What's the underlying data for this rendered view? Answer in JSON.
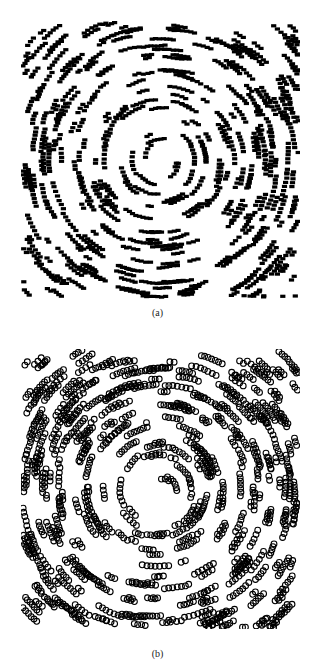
{
  "figure": {
    "panels": [
      {
        "id": "a",
        "caption": "(a)",
        "marker": "filled-rect"
      },
      {
        "id": "b",
        "caption": "(b)",
        "marker": "open-circle"
      }
    ]
  },
  "chart_data": [
    {
      "type": "scatter",
      "title": "",
      "caption": "(a)",
      "xlabel": "",
      "ylabel": "",
      "axes_visible": false,
      "grid": false,
      "legend": null,
      "marker": "small filled black rectangles",
      "pattern": "particles arranged along concentric circular swirl (vortex) around center; denser at corners, sparser near center",
      "approx_point_count": 1600,
      "xlim": [
        0,
        1
      ],
      "ylim": [
        0,
        1
      ],
      "generator": {
        "seed": 7,
        "count": 1600,
        "center": [
          0.5,
          0.5
        ]
      },
      "color": "#000000"
    },
    {
      "type": "scatter",
      "title": "",
      "caption": "(b)",
      "xlabel": "",
      "ylabel": "",
      "axes_visible": false,
      "grid": false,
      "legend": null,
      "marker": "open black circles",
      "pattern": "particles arranged along concentric circular swirl (vortex) around center; clustered streaks, denser at corners",
      "approx_point_count": 1600,
      "xlim": [
        0,
        1
      ],
      "ylim": [
        0,
        1
      ],
      "generator": {
        "seed": 11,
        "count": 1600,
        "center": [
          0.5,
          0.5
        ]
      },
      "color": "#000000"
    }
  ]
}
